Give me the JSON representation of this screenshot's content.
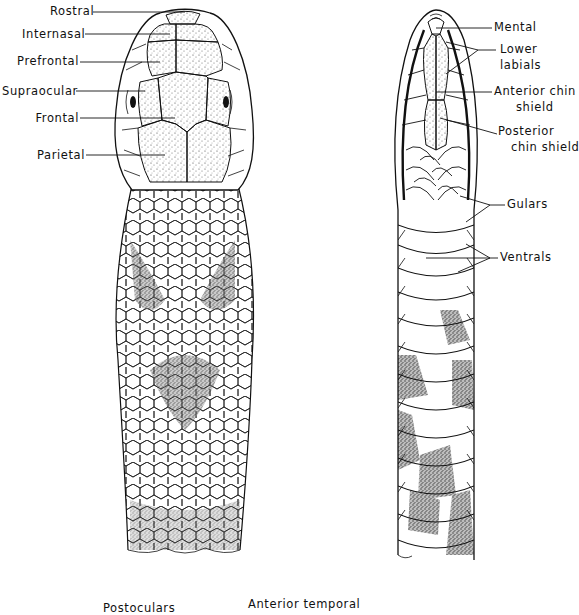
{
  "figure": {
    "dorsal_view": {
      "labels": [
        {
          "id": "rostral",
          "text": "Rostral"
        },
        {
          "id": "internasal",
          "text": "Internasal"
        },
        {
          "id": "prefrontal",
          "text": "Prefrontal"
        },
        {
          "id": "supraocular",
          "text": "Supraocular"
        },
        {
          "id": "frontal",
          "text": "Frontal"
        },
        {
          "id": "parietal",
          "text": "Parietal"
        }
      ]
    },
    "ventral_view": {
      "labels": [
        {
          "id": "mental",
          "text": "Mental"
        },
        {
          "id": "lower_labials_1",
          "text": "Lower"
        },
        {
          "id": "lower_labials_2",
          "text": "labials"
        },
        {
          "id": "anterior_chin_1",
          "text": "Anterior chin"
        },
        {
          "id": "anterior_chin_2",
          "text": "shield"
        },
        {
          "id": "posterior_chin_1",
          "text": "Posterior"
        },
        {
          "id": "posterior_chin_2",
          "text": "chin shield"
        },
        {
          "id": "gulars",
          "text": "Gulars"
        },
        {
          "id": "ventrals",
          "text": "Ventrals"
        }
      ]
    },
    "lateral_view_partial": {
      "labels": [
        {
          "id": "postoculars",
          "text": "Postoculars"
        },
        {
          "id": "anterior_temporal",
          "text": "Anterior  temporal"
        }
      ]
    },
    "colors": {
      "ink": "#111111",
      "stipple": "#555555",
      "background": "#ffffff"
    }
  }
}
